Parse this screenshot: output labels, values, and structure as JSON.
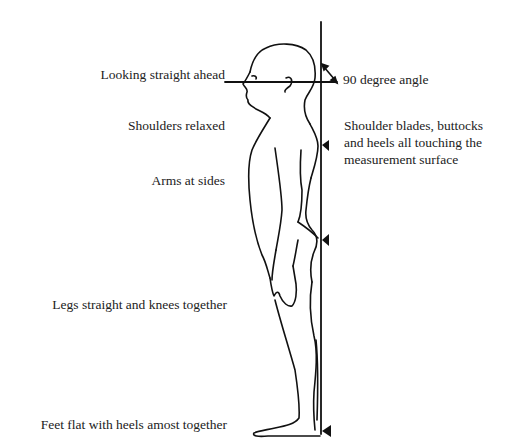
{
  "diagram": {
    "labels_left": [
      {
        "id": "looking",
        "text": "Looking straight ahead"
      },
      {
        "id": "shoulders",
        "text": "Shoulders relaxed"
      },
      {
        "id": "arms",
        "text": "Arms at sides"
      },
      {
        "id": "legs",
        "text": "Legs straight and knees together"
      },
      {
        "id": "feet",
        "text": "Feet flat with heels amost together"
      }
    ],
    "labels_right": [
      {
        "id": "angle",
        "text": "90 degree angle"
      },
      {
        "id": "contact_1",
        "text": "Shoulder blades, buttocks"
      },
      {
        "id": "contact_2",
        "text": "and heels all touching the"
      },
      {
        "id": "contact_3",
        "text": "measurement surface"
      }
    ],
    "markers": [
      "shoulder-blades",
      "buttocks",
      "heels"
    ],
    "colors": {
      "line": "#111111",
      "text": "#222222",
      "background": "#ffffff"
    }
  }
}
